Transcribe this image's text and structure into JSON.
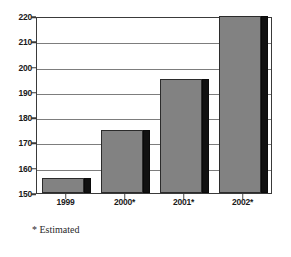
{
  "chart_data": {
    "type": "bar",
    "title": "",
    "subtitle": "",
    "xlabel": "",
    "ylabel": "",
    "categories": [
      "1999",
      "2000*",
      "2001*",
      "2002*"
    ],
    "values": [
      156,
      175,
      195,
      220
    ],
    "series": [
      {
        "name": "",
        "values": [
          156,
          175,
          195,
          220
        ]
      }
    ],
    "ylim": [
      150,
      220
    ],
    "yticks": [
      150,
      160,
      170,
      180,
      190,
      200,
      210,
      220
    ],
    "ytick_labels": [
      "150",
      "160",
      "170",
      "180",
      "190",
      "200",
      "210",
      "220"
    ],
    "grid": true,
    "grid_axis": "y",
    "legend": false,
    "legend_position": "none",
    "annotations": [
      "* Estimated"
    ],
    "bar_style": {
      "face_color": "#828282",
      "side_color": "#111111",
      "edge_color": "#2b2b2b",
      "shadow_3d": true
    },
    "frame_color": "#3a3a3a",
    "gridline_color": "#7d7d7d",
    "background_color": "#ffffff",
    "note": "2002* bar is clipped at the top of the 220 axis maximum"
  },
  "footnote": {
    "text": "* Estimated"
  }
}
